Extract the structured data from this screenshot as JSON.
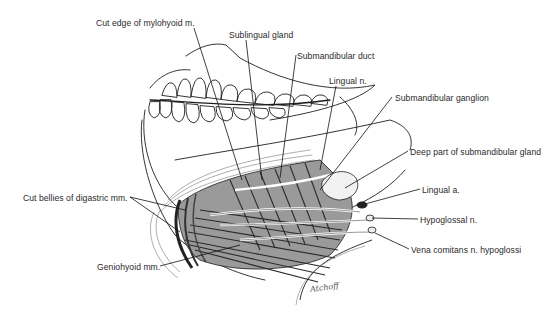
{
  "figure": {
    "signature": "Atchoff"
  },
  "labels": [
    {
      "id": "cut-edge-mylohyoid",
      "text": "Cut edge of mylohyoid m.",
      "x": 96,
      "y": 18
    },
    {
      "id": "sublingual-gland",
      "text": "Sublingual gland",
      "x": 229,
      "y": 30
    },
    {
      "id": "submandibular-duct",
      "text": "Submandibular duct",
      "x": 297,
      "y": 51
    },
    {
      "id": "lingual-n",
      "text": "Lingual n.",
      "x": 329,
      "y": 76
    },
    {
      "id": "submandibular-ganglion",
      "text": "Submandibular ganglion",
      "x": 395,
      "y": 93
    },
    {
      "id": "deep-part-submandibular-gland",
      "text": "Deep part of submandibular gland",
      "x": 410,
      "y": 147
    },
    {
      "id": "lingual-a",
      "text": "Lingual a.",
      "x": 422,
      "y": 185
    },
    {
      "id": "hypoglossal-n",
      "text": "Hypoglossal n.",
      "x": 420,
      "y": 215
    },
    {
      "id": "vena-comitans",
      "text": "Vena comitans n. hypoglossi",
      "x": 411,
      "y": 245
    },
    {
      "id": "cut-bellies-digastric",
      "text": "Cut bellies of digastric mm.",
      "x": 23,
      "y": 193
    },
    {
      "id": "geniohyoid-mm",
      "text": "Geniohyoid mm.",
      "x": 97,
      "y": 262
    }
  ],
  "colors": {
    "ink": "#1e1e1e",
    "label_text": "#2a2a2a",
    "background": "#ffffff",
    "shade": "#5a5a5a"
  }
}
